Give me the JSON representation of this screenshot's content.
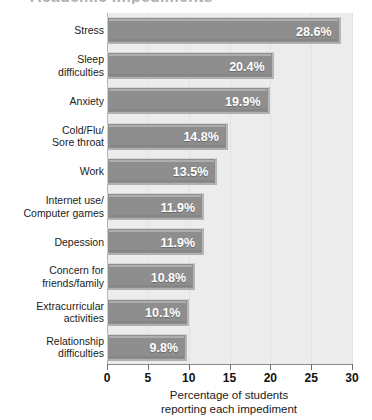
{
  "chart_data": {
    "type": "bar",
    "orientation": "horizontal",
    "title": "Academic Impediments",
    "categories": [
      "Stress",
      "Sleep\ndifficulties",
      "Anxiety",
      "Cold/Flu/\nSore throat",
      "Work",
      "Internet use/\nComputer games",
      "Depession",
      "Concern for\nfriends/family",
      "Extracurricular\nactivities",
      "Relationship\ndifficulties"
    ],
    "values": [
      28.6,
      20.4,
      19.9,
      14.8,
      13.5,
      11.9,
      11.9,
      10.8,
      10.1,
      9.8
    ],
    "value_labels": [
      "28.6%",
      "20.4%",
      "19.9%",
      "14.8%",
      "13.5%",
      "11.9%",
      "11.9%",
      "10.8%",
      "10.1%",
      "9.8%"
    ],
    "xlabel": "Percentage of students\nreporting  each impediment",
    "ylabel": "",
    "xlim": [
      0,
      30
    ],
    "xticks": [
      0,
      5,
      10,
      15,
      20,
      25,
      30
    ],
    "xtick_labels": [
      "0",
      "5",
      "10",
      "15",
      "20",
      "25",
      "30"
    ],
    "grid": false,
    "legend": false,
    "colors": {
      "bar_fill": "#8e8e8e",
      "bar_highlight": "#c9c9c9",
      "plot_background": "#ececec",
      "page_background": "#ffffff",
      "value_text": "#ffffff",
      "axis": "#6f6f6f",
      "text": "#1b1b1b"
    }
  }
}
